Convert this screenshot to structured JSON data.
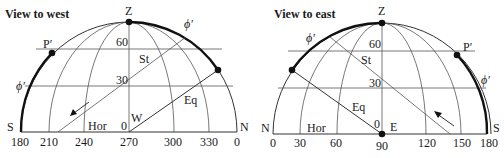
{
  "diagrams": [
    {
      "title": "View to west",
      "zenith_label": "Z",
      "left_end_label": "S",
      "right_end_label": "N",
      "center_point_label": "W",
      "pole_label": "P′",
      "latitude_label": "ϕ′",
      "star_path_label": "St",
      "equator_label": "Eq",
      "horizon_label": "Hor",
      "altitude_ticks": [
        "0",
        "30",
        "60"
      ],
      "azimuth_ticks": [
        "180",
        "210",
        "240",
        "270",
        "300",
        "330",
        "0"
      ]
    },
    {
      "title": "View to east",
      "zenith_label": "Z",
      "left_end_label": "N",
      "right_end_label": "S",
      "center_point_label": "E",
      "pole_label": "P′",
      "latitude_label": "ϕ′",
      "star_path_label": "St",
      "equator_label": "Eq",
      "horizon_label": "Hor",
      "altitude_ticks": [
        "0",
        "30",
        "60"
      ],
      "azimuth_ticks": [
        "0",
        "30",
        "60",
        "90",
        "120",
        "150",
        "180"
      ]
    }
  ]
}
